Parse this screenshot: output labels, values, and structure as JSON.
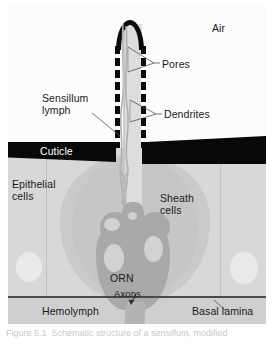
{
  "figure": {
    "caption": "Figure 5.1  Schematic structure of a sensillum, modified"
  },
  "labels": {
    "air": "Air",
    "pores": "Pores",
    "sensillum_lymph_line1": "Sensillum",
    "sensillum_lymph_line2": "lymph",
    "dendrites": "Dendrites",
    "cuticle": "Cuticle",
    "epithelial_line1": "Epithelial",
    "epithelial_line2": "cells",
    "sheath_line1": "Sheath",
    "sheath_line2": "cells",
    "orn": "ORN",
    "axons": "Axons",
    "hemolymph": "Hemolymph",
    "basal_lamina": "Basal lamina"
  },
  "colors": {
    "air_zone": "#fcfcfc",
    "epithelium_zone": "#d8d8d8",
    "hemolymph_zone": "#cfcfcf",
    "cuticle_black": "#080808",
    "sheath_gray": "#cacaca",
    "orn_gray": "#a9a9a9",
    "vacuole_gray": "#d2d2d2",
    "lymph_gray": "#dddddd",
    "leader_line": "#555555",
    "basal_lamina_line": "#4a4a4a",
    "label_text": "#1a1a1a",
    "cuticle_text": "#ffffff"
  },
  "structures": {
    "shaft_pore_count": 16,
    "dendrite_count": 3,
    "vacuole_count": 4,
    "epithelial_nucleus_count": 2
  }
}
